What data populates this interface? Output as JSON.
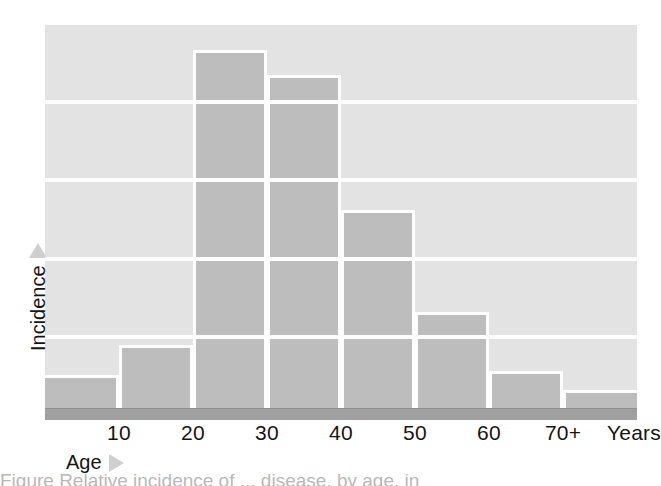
{
  "figure": {
    "caption_fragment": "Figure    Relative incidence of  ...  disease, by age, in"
  },
  "axes": {
    "x_title": "Age",
    "x_unit_label": "Years",
    "y_title": "Incidence",
    "x_arrow_icon": "triangle-right-icon",
    "y_arrow_icon": "triangle-up-icon"
  },
  "chart_data": {
    "type": "bar",
    "title": "",
    "subtitle": "",
    "xlabel": "Age",
    "ylabel": "Incidence",
    "categories": [
      "0–10",
      "10–20",
      "20–30",
      "30–40",
      "40–50",
      "50–60",
      "60–70",
      "70+"
    ],
    "bin_edges": [
      0,
      10,
      20,
      30,
      40,
      50,
      60,
      70,
      80
    ],
    "tick_labels": [
      "10",
      "20",
      "30",
      "40",
      "50",
      "60",
      "70+"
    ],
    "tick_unit": "Years",
    "values": [
      8.6,
      16.4,
      93.5,
      86.9,
      51.7,
      25.1,
      9.7,
      4.7
    ],
    "values_note": "relative incidence, unitless; read as percent of plot height",
    "ylim": [
      0,
      100
    ],
    "xlim": [
      0,
      80
    ],
    "grid": true,
    "grid_orientation": "horizontal",
    "gridline_values": [
      18.5,
      38.9,
      59.5,
      79.9
    ],
    "legend": null,
    "legend_position": "none",
    "colors": {
      "bar_fill": "#bdbdbd",
      "bar_edge": "#fdfdfd",
      "panel_background": "#e3e3e3",
      "gridline": "#fdfdfd",
      "axis_band": "#a0a0a0",
      "text": "#151515",
      "arrow": "#cfcfcf"
    }
  }
}
